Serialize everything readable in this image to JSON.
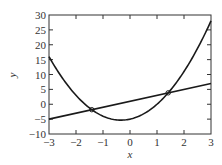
{
  "chart_data": {
    "type": "line",
    "title": "",
    "xlabel": "x",
    "ylabel": "y",
    "xlim": [
      -3,
      3
    ],
    "ylim": [
      -10,
      30
    ],
    "grid": false,
    "legend": null,
    "x_ticks": [
      -3,
      -2,
      -1,
      0,
      1,
      2,
      3
    ],
    "x_tick_labels": [
      "−3",
      "−2",
      "−1",
      "0",
      "1",
      "2",
      "3"
    ],
    "y_ticks": [
      -10,
      -5,
      0,
      5,
      10,
      15,
      20,
      25,
      30
    ],
    "y_tick_labels": [
      "−10",
      "−5",
      "0",
      "5",
      "10",
      "15",
      "20",
      "25",
      "30"
    ],
    "series": [
      {
        "name": "parabola y = 3x^2 + 2x - 5",
        "x": [
          -3,
          -2.5,
          -2,
          -1.5,
          -1,
          -0.5,
          -0.333,
          0,
          0.5,
          1,
          1.5,
          2,
          2.5,
          3
        ],
        "values": [
          16,
          8.75,
          3,
          -1.25,
          -4,
          -5.25,
          -5.33,
          -5,
          -3.25,
          0,
          4.75,
          11,
          18.75,
          28
        ]
      },
      {
        "name": "line y = 2x + 1",
        "x": [
          -3,
          3
        ],
        "values": [
          -5,
          7
        ]
      }
    ],
    "annotations": [
      {
        "type": "intersection-marker",
        "x": -1.414,
        "y": -1.83
      },
      {
        "type": "intersection-marker",
        "x": 1.414,
        "y": 3.83
      }
    ],
    "colors": {
      "curve": "#1a1a1a",
      "axes": "#333333",
      "background": "#ffffff"
    }
  }
}
